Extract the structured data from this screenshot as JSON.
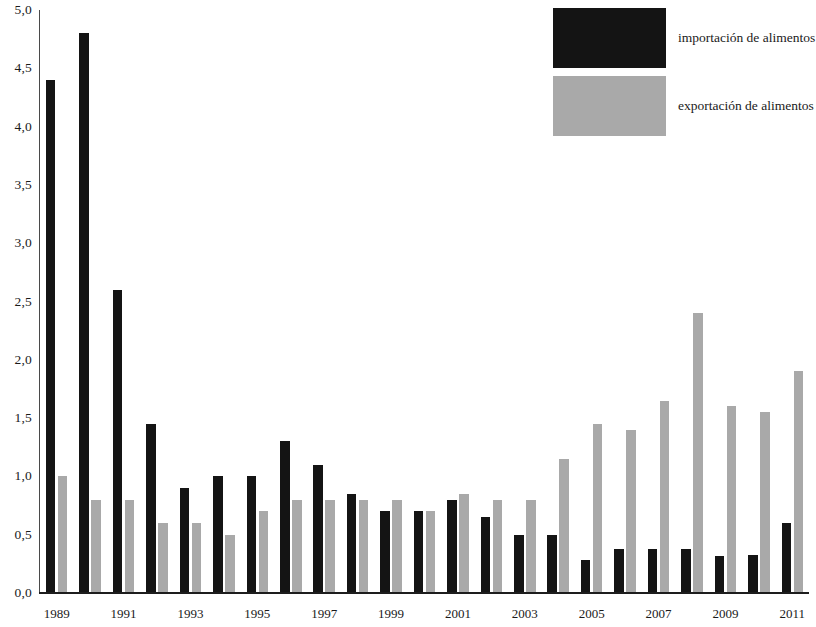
{
  "chart_data": {
    "type": "bar",
    "title": "",
    "subtitle": "",
    "xlabel": "",
    "ylabel": "",
    "ylim": [
      0.0,
      5.0
    ],
    "ytick_step": 0.5,
    "grid": false,
    "decimal_separator": ",",
    "legend_position": "top-right",
    "categories": [
      "1989",
      "1990",
      "1991",
      "1992",
      "1993",
      "1994",
      "1995",
      "1996",
      "1997",
      "1998",
      "1999",
      "2000",
      "2001",
      "2002",
      "2003",
      "2004",
      "2005",
      "2006",
      "2007",
      "2008",
      "2009",
      "2010",
      "2011"
    ],
    "tick_labels": [
      "1989",
      "1991",
      "1993",
      "1995",
      "1997",
      "1999",
      "2001",
      "2003",
      "2005",
      "2007",
      "2009",
      "2011"
    ],
    "ytick_labels": [
      "0,0",
      "0,5",
      "1,0",
      "1,5",
      "2,0",
      "2,5",
      "3,0",
      "3,5",
      "4,0",
      "4,5",
      "5,0"
    ],
    "series": [
      {
        "name": "importación de alimentos",
        "color": "#141414",
        "values": [
          4.4,
          4.8,
          2.6,
          1.45,
          0.9,
          1.0,
          1.0,
          1.3,
          1.1,
          0.85,
          0.7,
          0.7,
          0.8,
          0.65,
          0.5,
          0.5,
          0.28,
          0.38,
          0.38,
          0.38,
          0.32,
          0.33,
          0.6
        ]
      },
      {
        "name": "exportación de alimentos",
        "color": "#a9a9a9",
        "values": [
          1.0,
          0.8,
          0.8,
          0.6,
          0.6,
          0.5,
          0.7,
          0.8,
          0.8,
          0.8,
          0.8,
          0.7,
          0.85,
          0.8,
          0.8,
          1.15,
          1.45,
          1.4,
          1.65,
          2.4,
          1.6,
          1.55,
          1.9
        ]
      }
    ]
  },
  "legend": {
    "items": [
      {
        "label": "importación de alimentos",
        "swatch": "import"
      },
      {
        "label": "exportación de alimentos",
        "swatch": "export"
      }
    ]
  },
  "colors": {
    "import_bar": "#141414",
    "export_bar": "#a9a9a9",
    "axis": "#1d1d1d",
    "text": "#1a1a1a",
    "background": "#ffffff"
  }
}
